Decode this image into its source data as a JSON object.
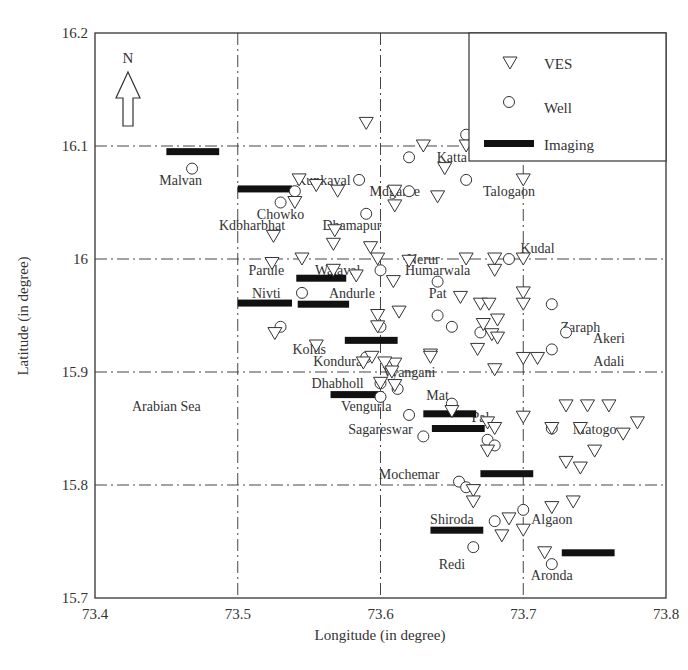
{
  "chart_data": {
    "type": "scatter",
    "title": "",
    "xlabel": "Longitude (in degree)",
    "ylabel": "Latitude (in degree)",
    "xlim": [
      73.4,
      73.8
    ],
    "ylim": [
      15.7,
      16.2
    ],
    "xticks": [
      "73.4",
      "73.5",
      "73.6",
      "73.7",
      "73.8"
    ],
    "yticks": [
      "15.7",
      "15.8",
      "15.9",
      "16",
      "16.1",
      "16.2"
    ],
    "grid": true,
    "legend_position": "upper right",
    "north_arrow_label": "N",
    "legend": [
      {
        "name": "VES",
        "marker": "inverted-triangle"
      },
      {
        "name": "Well",
        "marker": "circle"
      },
      {
        "name": "Imaging",
        "marker": "thick-bar"
      }
    ],
    "annotations": [
      {
        "text": "Arabian Sea",
        "x": 73.45,
        "y": 15.87
      },
      {
        "text": "Malvan",
        "x": 73.46,
        "y": 16.07
      },
      {
        "text": "Kunkaval",
        "x": 73.56,
        "y": 16.07
      },
      {
        "text": "Katta",
        "x": 73.65,
        "y": 16.09
      },
      {
        "text": "Mdgarne",
        "x": 73.61,
        "y": 16.06
      },
      {
        "text": "Talogaon",
        "x": 73.69,
        "y": 16.06
      },
      {
        "text": "Chowko",
        "x": 73.53,
        "y": 16.04
      },
      {
        "text": "Kdbharbhat",
        "x": 73.51,
        "y": 16.03
      },
      {
        "text": "Dhamapur",
        "x": 73.58,
        "y": 16.03
      },
      {
        "text": "Kudal",
        "x": 73.71,
        "y": 16.01
      },
      {
        "text": "Nerur",
        "x": 73.63,
        "y": 16.0
      },
      {
        "text": "Humarwala",
        "x": 73.64,
        "y": 15.99
      },
      {
        "text": "Parule",
        "x": 73.52,
        "y": 15.99
      },
      {
        "text": "Walaval",
        "x": 73.57,
        "y": 15.99
      },
      {
        "text": "Nivti",
        "x": 73.52,
        "y": 15.97
      },
      {
        "text": "Andurle",
        "x": 73.58,
        "y": 15.97
      },
      {
        "text": "Pat",
        "x": 73.64,
        "y": 15.97
      },
      {
        "text": "Zaraph",
        "x": 73.74,
        "y": 15.94
      },
      {
        "text": "Akeri",
        "x": 73.76,
        "y": 15.93
      },
      {
        "text": "Adali",
        "x": 73.76,
        "y": 15.91
      },
      {
        "text": "Kolus",
        "x": 73.55,
        "y": 15.92
      },
      {
        "text": "Kondura",
        "x": 73.57,
        "y": 15.91
      },
      {
        "text": "Vyangani",
        "x": 73.62,
        "y": 15.9
      },
      {
        "text": "Dhabholl",
        "x": 73.57,
        "y": 15.89
      },
      {
        "text": "Mat",
        "x": 73.64,
        "y": 15.88
      },
      {
        "text": "Vengurla",
        "x": 73.59,
        "y": 15.87
      },
      {
        "text": "Pal",
        "x": 73.67,
        "y": 15.86
      },
      {
        "text": "Sagareswar",
        "x": 73.6,
        "y": 15.85
      },
      {
        "text": "Matogo",
        "x": 73.75,
        "y": 15.85
      },
      {
        "text": "Mochemar",
        "x": 73.62,
        "y": 15.81
      },
      {
        "text": "Shiroda",
        "x": 73.65,
        "y": 15.77
      },
      {
        "text": "Algaon",
        "x": 73.72,
        "y": 15.77
      },
      {
        "text": "Redi",
        "x": 73.65,
        "y": 15.73
      },
      {
        "text": "Aronda",
        "x": 73.72,
        "y": 15.72
      }
    ],
    "series": [
      {
        "name": "VES",
        "marker": "inverted-triangle",
        "points": [
          [
            73.59,
            16.12
          ],
          [
            73.63,
            16.1
          ],
          [
            73.66,
            16.1
          ],
          [
            73.645,
            16.08
          ],
          [
            73.543,
            16.07
          ],
          [
            73.555,
            16.065
          ],
          [
            73.57,
            16.06
          ],
          [
            73.54,
            16.05
          ],
          [
            73.61,
            16.06
          ],
          [
            73.64,
            16.055
          ],
          [
            73.61,
            16.047
          ],
          [
            73.7,
            16.07
          ],
          [
            73.568,
            16.025
          ],
          [
            73.525,
            16.02
          ],
          [
            73.567,
            16.013
          ],
          [
            73.593,
            16.01
          ],
          [
            73.545,
            16.0
          ],
          [
            73.598,
            16.0
          ],
          [
            73.62,
            15.998
          ],
          [
            73.567,
            15.99
          ],
          [
            73.583,
            15.985
          ],
          [
            73.609,
            15.98
          ],
          [
            73.7,
            16.0
          ],
          [
            73.7,
            15.97
          ],
          [
            73.68,
            15.99
          ],
          [
            73.66,
            16.0
          ],
          [
            73.68,
            16.0
          ],
          [
            73.524,
            15.996
          ],
          [
            73.656,
            15.966
          ],
          [
            73.67,
            15.96
          ],
          [
            73.613,
            15.953
          ],
          [
            73.7,
            15.96
          ],
          [
            73.676,
            15.96
          ],
          [
            73.598,
            15.95
          ],
          [
            73.598,
            15.94
          ],
          [
            73.526,
            15.934
          ],
          [
            73.555,
            15.923
          ],
          [
            73.682,
            15.946
          ],
          [
            73.672,
            15.942
          ],
          [
            73.678,
            15.933
          ],
          [
            73.682,
            15.93
          ],
          [
            73.668,
            15.92
          ],
          [
            73.635,
            15.915
          ],
          [
            73.594,
            15.913
          ],
          [
            73.61,
            15.907
          ],
          [
            73.603,
            15.908
          ],
          [
            73.588,
            15.908
          ],
          [
            73.635,
            15.913
          ],
          [
            73.7,
            15.912
          ],
          [
            73.71,
            15.912
          ],
          [
            73.68,
            15.902
          ],
          [
            73.608,
            15.9
          ],
          [
            73.61,
            15.888
          ],
          [
            73.6,
            15.89
          ],
          [
            73.73,
            15.87
          ],
          [
            73.745,
            15.87
          ],
          [
            73.76,
            15.87
          ],
          [
            73.72,
            15.85
          ],
          [
            73.74,
            15.85
          ],
          [
            73.78,
            15.855
          ],
          [
            73.77,
            15.845
          ],
          [
            73.75,
            15.83
          ],
          [
            73.73,
            15.82
          ],
          [
            73.74,
            15.815
          ],
          [
            73.7,
            15.86
          ],
          [
            73.675,
            15.855
          ],
          [
            73.68,
            15.85
          ],
          [
            73.675,
            15.83
          ],
          [
            73.65,
            15.865
          ],
          [
            73.665,
            15.795
          ],
          [
            73.665,
            15.785
          ],
          [
            73.72,
            15.78
          ],
          [
            73.735,
            15.785
          ],
          [
            73.69,
            15.77
          ],
          [
            73.685,
            15.755
          ],
          [
            73.7,
            15.76
          ],
          [
            73.715,
            15.74
          ]
        ]
      },
      {
        "name": "Well",
        "marker": "circle",
        "points": [
          [
            73.468,
            16.08
          ],
          [
            73.53,
            16.05
          ],
          [
            73.54,
            16.06
          ],
          [
            73.585,
            16.07
          ],
          [
            73.62,
            16.09
          ],
          [
            73.66,
            16.11
          ],
          [
            73.66,
            16.07
          ],
          [
            73.62,
            16.06
          ],
          [
            73.59,
            16.04
          ],
          [
            73.6,
            15.99
          ],
          [
            73.69,
            16.0
          ],
          [
            73.64,
            15.98
          ],
          [
            73.545,
            15.97
          ],
          [
            73.64,
            15.95
          ],
          [
            73.65,
            15.94
          ],
          [
            73.67,
            15.935
          ],
          [
            73.72,
            15.96
          ],
          [
            73.73,
            15.935
          ],
          [
            73.72,
            15.92
          ],
          [
            73.53,
            15.94
          ],
          [
            73.6,
            15.94
          ],
          [
            73.59,
            15.913
          ],
          [
            73.6,
            15.89
          ],
          [
            73.612,
            15.885
          ],
          [
            73.6,
            15.878
          ],
          [
            73.65,
            15.872
          ],
          [
            73.62,
            15.862
          ],
          [
            73.63,
            15.843
          ],
          [
            73.675,
            15.84
          ],
          [
            73.68,
            15.835
          ],
          [
            73.72,
            15.85
          ],
          [
            73.655,
            15.803
          ],
          [
            73.66,
            15.798
          ],
          [
            73.7,
            15.778
          ],
          [
            73.68,
            15.768
          ],
          [
            73.665,
            15.745
          ],
          [
            73.72,
            15.73
          ]
        ]
      },
      {
        "name": "Imaging",
        "marker": "thick-bar",
        "segments": [
          [
            73.45,
            73.487,
            16.095
          ],
          [
            73.5,
            73.538,
            16.062
          ],
          [
            73.541,
            73.576,
            15.983
          ],
          [
            73.5,
            73.538,
            15.961
          ],
          [
            73.542,
            73.578,
            15.96
          ],
          [
            73.575,
            73.612,
            15.928
          ],
          [
            73.565,
            73.602,
            15.88
          ],
          [
            73.63,
            73.667,
            15.863
          ],
          [
            73.636,
            73.673,
            15.85
          ],
          [
            73.67,
            73.707,
            15.81
          ],
          [
            73.635,
            73.672,
            15.76
          ],
          [
            73.727,
            73.764,
            15.74
          ]
        ]
      }
    ]
  }
}
